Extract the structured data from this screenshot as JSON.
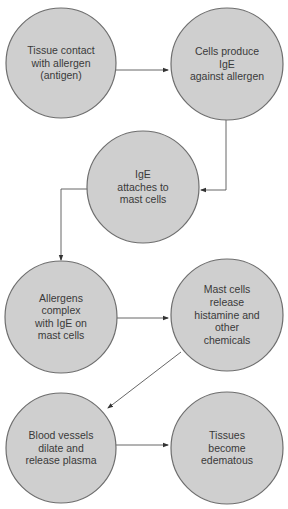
{
  "diagram": {
    "type": "flowchart",
    "nodes": [
      {
        "id": "n1",
        "lines": [
          "Tissue contact",
          "with allergen",
          "(antigen)"
        ]
      },
      {
        "id": "n2",
        "lines": [
          "Cells produce",
          "IgE",
          "against allergen"
        ]
      },
      {
        "id": "n3",
        "lines": [
          "IgE",
          "attaches to",
          "mast cells"
        ]
      },
      {
        "id": "n4",
        "lines": [
          "Allergens",
          "complex",
          "with IgE on",
          "mast cells"
        ]
      },
      {
        "id": "n5",
        "lines": [
          "Mast cells",
          "release",
          "histamine and",
          "other",
          "chemicals"
        ]
      },
      {
        "id": "n6",
        "lines": [
          "Blood vessels",
          "dilate and",
          "release plasma"
        ]
      },
      {
        "id": "n7",
        "lines": [
          "Tissues",
          "become",
          "edematous"
        ]
      }
    ],
    "edges": [
      {
        "from": "n1",
        "to": "n2"
      },
      {
        "from": "n2",
        "to": "n3"
      },
      {
        "from": "n3",
        "to": "n4"
      },
      {
        "from": "n4",
        "to": "n5"
      },
      {
        "from": "n5",
        "to": "n6"
      },
      {
        "from": "n6",
        "to": "n7"
      }
    ],
    "colors": {
      "node_fill": "#cfcfcf",
      "node_stroke": "#6e6e6e",
      "text": "#3a3a3a",
      "edge": "#555555"
    }
  }
}
